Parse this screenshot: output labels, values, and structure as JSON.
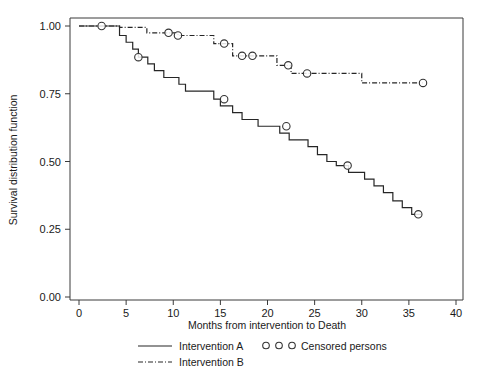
{
  "chart_data": {
    "type": "line",
    "title": "",
    "subtitle": "",
    "xlabel": "Months from intervention to Death",
    "ylabel": "Survival distribution function",
    "xlim": [
      0,
      40
    ],
    "ylim": [
      0.0,
      1.0
    ],
    "xticks": [
      "0",
      "5",
      "10",
      "15",
      "20",
      "25",
      "30",
      "35",
      "40"
    ],
    "xtick_values": [
      0,
      5,
      10,
      15,
      20,
      25,
      30,
      35,
      40
    ],
    "yticks": [
      "0.00",
      "0.25",
      "0.50",
      "0.75",
      "1.00"
    ],
    "ytick_values": [
      0.0,
      0.25,
      0.5,
      0.75,
      1.0
    ],
    "grid": false,
    "legend_position": "below",
    "series": [
      {
        "name": "Intervention A",
        "style": "solid",
        "x": [
          0.0,
          1.2,
          4.3,
          4.3,
          5.0,
          5.0,
          5.7,
          5.7,
          6.3,
          6.3,
          7.3,
          7.3,
          8.0,
          8.0,
          9.0,
          9.0,
          10.6,
          10.6,
          11.3,
          11.3,
          12.0,
          12.0,
          14.3,
          14.3,
          15.0,
          15.0,
          16.3,
          16.3,
          17.3,
          17.3,
          19.0,
          19.0,
          20.0,
          20.0,
          21.3,
          21.3,
          22.3,
          22.3,
          24.3,
          24.3,
          25.3,
          25.3,
          26.3,
          26.3,
          27.3,
          27.3,
          28.6,
          28.6,
          29.6,
          29.6,
          30.3,
          30.3,
          31.3,
          31.3,
          32.3,
          32.3,
          33.3,
          33.3,
          34.3,
          34.3,
          35.3,
          35.3,
          36.3
        ],
        "y": [
          1.0,
          1.0,
          1.0,
          0.965,
          0.965,
          0.94,
          0.94,
          0.915,
          0.915,
          0.885,
          0.885,
          0.86,
          0.86,
          0.835,
          0.835,
          0.81,
          0.81,
          0.785,
          0.785,
          0.76,
          0.76,
          0.76,
          0.76,
          0.73,
          0.73,
          0.705,
          0.705,
          0.68,
          0.68,
          0.655,
          0.655,
          0.63,
          0.63,
          0.63,
          0.63,
          0.605,
          0.605,
          0.58,
          0.58,
          0.555,
          0.555,
          0.525,
          0.525,
          0.5,
          0.5,
          0.485,
          0.485,
          0.46,
          0.46,
          0.46,
          0.46,
          0.435,
          0.435,
          0.41,
          0.41,
          0.385,
          0.385,
          0.355,
          0.355,
          0.33,
          0.33,
          0.305,
          0.305
        ],
        "censored_x": [
          6.3,
          15.4,
          22.0,
          28.5,
          36.0
        ],
        "censored_y": [
          0.885,
          0.73,
          0.63,
          0.485,
          0.305
        ]
      },
      {
        "name": "Intervention B",
        "style": "dash-dot",
        "x": [
          0.0,
          4.3,
          4.3,
          7.2,
          7.2,
          10.5,
          10.5,
          14.3,
          14.3,
          16.3,
          16.3,
          21.0,
          21.0,
          22.5,
          22.5,
          30.0,
          30.0,
          36.5
        ],
        "y": [
          1.0,
          1.0,
          0.995,
          0.995,
          0.975,
          0.975,
          0.965,
          0.965,
          0.935,
          0.935,
          0.89,
          0.89,
          0.855,
          0.855,
          0.825,
          0.825,
          0.79,
          0.79
        ],
        "censored_x": [
          2.4,
          9.5,
          10.5,
          15.4,
          17.3,
          18.4,
          22.2,
          24.2,
          36.5
        ],
        "censored_y": [
          1.0,
          0.975,
          0.965,
          0.935,
          0.89,
          0.89,
          0.855,
          0.825,
          0.79
        ]
      }
    ],
    "censored_marker": "open-circle"
  },
  "legend": {
    "entries": [
      {
        "label": "Intervention A",
        "marker": "solid-line"
      },
      {
        "label": "Intervention B",
        "marker": "dash-dot-line"
      },
      {
        "label": "Censored persons",
        "marker": "open-circles"
      }
    ]
  }
}
